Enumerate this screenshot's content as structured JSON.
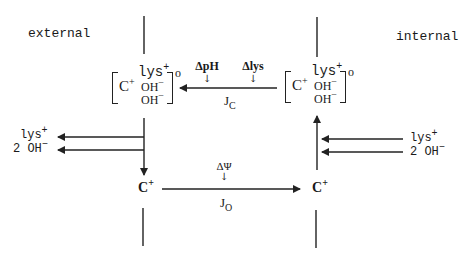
{
  "labels": {
    "external": "external",
    "internal": "internal"
  },
  "complex_left": {
    "cation": "C",
    "cation_charge": "+",
    "lys": "lys",
    "lys_charge": "+",
    "oh1": "OH",
    "oh1_charge": "−",
    "oh2": "OH",
    "oh2_charge": "−",
    "superscript": "o"
  },
  "complex_right": {
    "cation": "C",
    "cation_charge": "+",
    "lys": "lys",
    "lys_charge": "+",
    "oh1": "OH",
    "oh1_charge": "−",
    "oh2": "OH",
    "oh2_charge": "−",
    "superscript": "o"
  },
  "top_flux": {
    "driving_force_1": "ΔpH",
    "driving_force_2": "Δlys",
    "flux_label": "J",
    "flux_sub": "C",
    "arrow_mark": "↓"
  },
  "bottom_flux": {
    "driving_force": "ΔΨ",
    "flux_label": "J",
    "flux_sub": "O",
    "arrow_mark": "↓"
  },
  "left_release": {
    "lys": "lys",
    "lys_charge": "+",
    "oh": "2 OH",
    "oh_charge": "−"
  },
  "right_uptake": {
    "lys": "lys",
    "lys_charge": "+",
    "oh": "2 OH",
    "oh_charge": "−"
  },
  "cation_left": {
    "symbol": "C",
    "charge": "+"
  },
  "cation_right": {
    "symbol": "C",
    "charge": "+"
  },
  "colors": {
    "line": "#222222",
    "background": "#ffffff"
  }
}
